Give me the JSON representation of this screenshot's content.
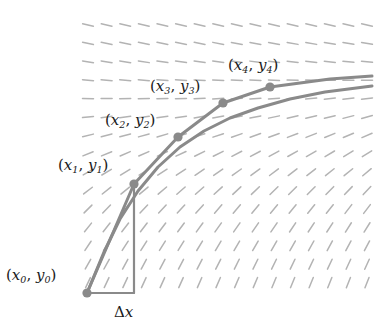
{
  "figure": {
    "colors": {
      "curve": "#8a8a8a",
      "polyline": "#8a8a8a",
      "point": "#8a8a8a",
      "slope_mark": "#b3b3b3",
      "triangle": "#8a8a8a",
      "label_text": "#1a1a1a",
      "background": "#ffffff"
    },
    "labels": {
      "p0": {
        "open": "(",
        "x": "x",
        "xsub": "0",
        "comma": ", ",
        "y": "y",
        "ysub": "0",
        "close": ")"
      },
      "p1": {
        "open": "(",
        "x": "x",
        "xsub": "1",
        "comma": ", ",
        "y": "y",
        "ysub": "1",
        "close": ")"
      },
      "p2": {
        "open": "(",
        "x": "x",
        "xsub": "2",
        "comma": ", ",
        "y": "y",
        "ysub": "2",
        "close": ")"
      },
      "p3": {
        "open": "(",
        "x": "x",
        "xsub": "3",
        "comma": ", ",
        "y": "y",
        "ysub": "3",
        "close": ")"
      },
      "p4": {
        "open": "(",
        "x": "x",
        "xsub": "4",
        "comma": ", ",
        "y": "y",
        "ysub": "4",
        "close": ")"
      },
      "delta_x": {
        "delta": "Δ",
        "var": "x"
      }
    }
  },
  "chart_data": {
    "type": "line",
    "xlabel": "",
    "ylabel": "",
    "grid": false,
    "legend": "none",
    "xlim": [
      80,
      372
    ],
    "ylim": [
      18,
      300
    ],
    "euler_points": [
      {
        "name": "(x0, y0)",
        "px": 87,
        "py": 293
      },
      {
        "name": "(x1, y1)",
        "px": 134,
        "py": 184
      },
      {
        "name": "(x2, y2)",
        "px": 178,
        "py": 137
      },
      {
        "name": "(x3, y3)",
        "px": 223,
        "py": 103
      },
      {
        "name": "(x4, y4)",
        "px": 270,
        "py": 87
      }
    ],
    "euler_polyline_extension": [
      {
        "px": 270,
        "py": 87
      },
      {
        "px": 330,
        "py": 79
      },
      {
        "px": 372,
        "py": 76
      }
    ],
    "solution_curve": [
      {
        "px": 87,
        "py": 293
      },
      {
        "px": 104,
        "py": 252
      },
      {
        "px": 120,
        "py": 219
      },
      {
        "px": 138,
        "py": 191
      },
      {
        "px": 158,
        "py": 167
      },
      {
        "px": 180,
        "py": 147
      },
      {
        "px": 204,
        "py": 131
      },
      {
        "px": 230,
        "py": 118
      },
      {
        "px": 258,
        "py": 108
      },
      {
        "px": 290,
        "py": 99
      },
      {
        "px": 325,
        "py": 92
      },
      {
        "px": 372,
        "py": 86
      }
    ],
    "triangle": {
      "vertex_start": {
        "px": 87,
        "py": 293
      },
      "vertex_corner": {
        "px": 134,
        "py": 293
      },
      "vertex_apex": {
        "px": 134,
        "py": 184
      },
      "base_label": "Δx"
    },
    "slope_field": {
      "x_start": 88,
      "x_step": 18.6,
      "x_count": 16,
      "y_start": 25,
      "y_step": 18.4,
      "y_count": 15,
      "dash_length": 11,
      "description": "Dash slopes decrease with increasing y and increase with increasing x; near-horizontal/slightly negative at top, steeply positive at bottom-right."
    }
  }
}
